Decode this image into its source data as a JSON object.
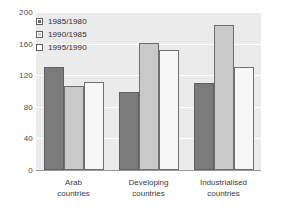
{
  "chart_data": {
    "type": "bar",
    "title": "",
    "xlabel": "",
    "ylabel": "",
    "ylim": [
      0,
      200
    ],
    "yticks": [
      0,
      40,
      80,
      120,
      160,
      200
    ],
    "grid": true,
    "legend_position": "top-left",
    "categories": [
      "Arab countries",
      "Developing countries",
      "Industrialised countries"
    ],
    "category_lines": [
      [
        "Arab",
        "countries"
      ],
      [
        "Developing",
        "countries"
      ],
      [
        "Industrialised",
        "countries"
      ]
    ],
    "series": [
      {
        "name": "1985/1980",
        "color": "#7b7b7b",
        "values": [
          131,
          99,
          110
        ]
      },
      {
        "name": "1990/1985",
        "color": "#c9c9c9",
        "values": [
          106,
          161,
          183
        ]
      },
      {
        "name": "1995/1990",
        "color": "#f7f7f7",
        "values": [
          112,
          152,
          131
        ]
      }
    ]
  },
  "legend": {
    "items": [
      {
        "label": "1985/1980"
      },
      {
        "label": "1990/1985"
      },
      {
        "label": "1995/1990"
      }
    ]
  },
  "axis": {
    "y_tick_labels": [
      "200",
      "160",
      "120",
      "80",
      "40",
      "0"
    ]
  }
}
